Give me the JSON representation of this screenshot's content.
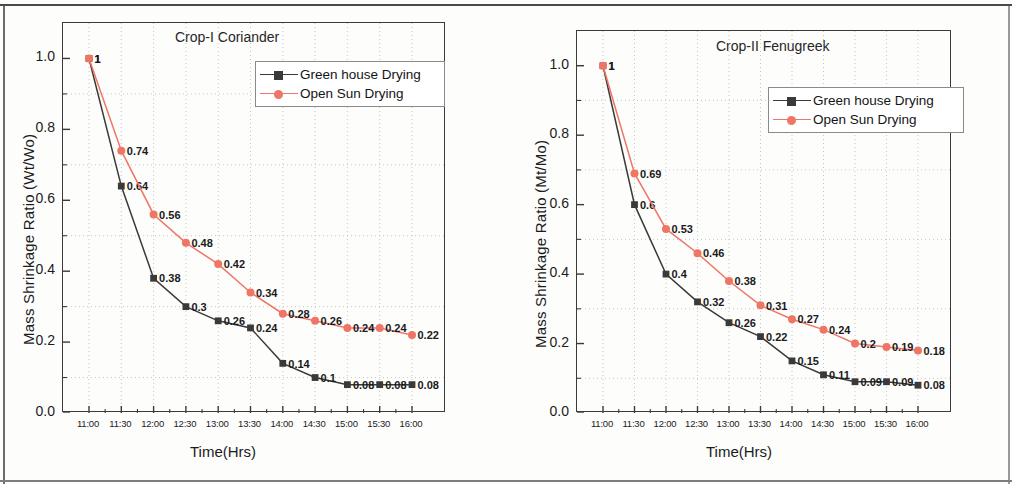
{
  "figure": {
    "panel_count": 2,
    "colors": {
      "green_house": "#3a3a3a",
      "open_sun": "#ef7666",
      "axis": "#3a3a3a",
      "grid": "#b9b9b9"
    }
  },
  "legend": {
    "series": [
      {
        "label": "Green house Drying",
        "color": "#3a3a3a",
        "marker": "square"
      },
      {
        "label": "Open Sun Drying",
        "color": "#ef7666",
        "marker": "circle"
      }
    ]
  },
  "chart_data": [
    {
      "type": "line",
      "title": "Crop-I Coriander",
      "xlabel": "Time(Hrs)",
      "ylabel": "Mass Shrinkage Ratio (Wt/Wo)",
      "categories": [
        "11:00",
        "11:30",
        "12:00",
        "12:30",
        "13:00",
        "13:30",
        "14:00",
        "14:30",
        "15:00",
        "15:30",
        "16:00"
      ],
      "ylim": [
        0.0,
        1.1
      ],
      "yticks": [
        "0.0",
        "0.2",
        "0.4",
        "0.6",
        "0.8",
        "1.0"
      ],
      "ytick_values": [
        0.0,
        0.2,
        0.4,
        0.6,
        0.8,
        1.0
      ],
      "grid": "dotted",
      "legend_position": "top-right",
      "series": [
        {
          "name": "Green house Drying",
          "color": "#3a3a3a",
          "marker": "square",
          "values": [
            1,
            0.64,
            0.38,
            0.3,
            0.26,
            0.24,
            0.14,
            0.1,
            0.08,
            0.08,
            0.08
          ],
          "labels": [
            "1",
            "0.64",
            "0.38",
            "0.3",
            "0.26",
            "0.24",
            "0.14",
            "0.1",
            "0.08",
            "0.08",
            "0.08"
          ]
        },
        {
          "name": "Open Sun Drying",
          "color": "#ef7666",
          "marker": "circle",
          "values": [
            1,
            0.74,
            0.56,
            0.48,
            0.42,
            0.34,
            0.28,
            0.26,
            0.24,
            0.24,
            0.22
          ],
          "labels": [
            "1",
            "0.74",
            "0.56",
            "0.48",
            "0.42",
            "0.34",
            "0.28",
            "0.26",
            "0.24",
            "0.24",
            "0.22"
          ]
        }
      ]
    },
    {
      "type": "line",
      "title": "Crop-II Fenugreek",
      "xlabel": "Time(Hrs)",
      "ylabel": "Mass Shrinkage Ratio (Mt/Mo)",
      "categories": [
        "11:00",
        "11:30",
        "12:00",
        "12:30",
        "13:00",
        "13:30",
        "14:00",
        "14:30",
        "15:00",
        "15:30",
        "16:00"
      ],
      "ylim": [
        0.0,
        1.1
      ],
      "yticks": [
        "0.0",
        "0.2",
        "0.4",
        "0.6",
        "0.8",
        "1.0"
      ],
      "ytick_values": [
        0.0,
        0.2,
        0.4,
        0.6,
        0.8,
        1.0
      ],
      "grid": "dotted",
      "legend_position": "top-right",
      "series": [
        {
          "name": "Green house Drying",
          "color": "#3a3a3a",
          "marker": "square",
          "values": [
            1,
            0.6,
            0.4,
            0.32,
            0.26,
            0.22,
            0.15,
            0.11,
            0.09,
            0.09,
            0.08
          ],
          "labels": [
            "1",
            "0.6",
            "0.4",
            "0.32",
            "0.26",
            "0.22",
            "0.15",
            "0.11",
            "0.09",
            "0.09",
            "0.08"
          ]
        },
        {
          "name": "Open Sun Drying",
          "color": "#ef7666",
          "marker": "circle",
          "values": [
            1,
            0.69,
            0.53,
            0.46,
            0.38,
            0.31,
            0.27,
            0.24,
            0.2,
            0.19,
            0.18
          ],
          "labels": [
            "1",
            "0.69",
            "0.53",
            "0.46",
            "0.38",
            "0.31",
            "0.27",
            "0.24",
            "0.2",
            "0.19",
            "0.18"
          ]
        }
      ]
    }
  ]
}
